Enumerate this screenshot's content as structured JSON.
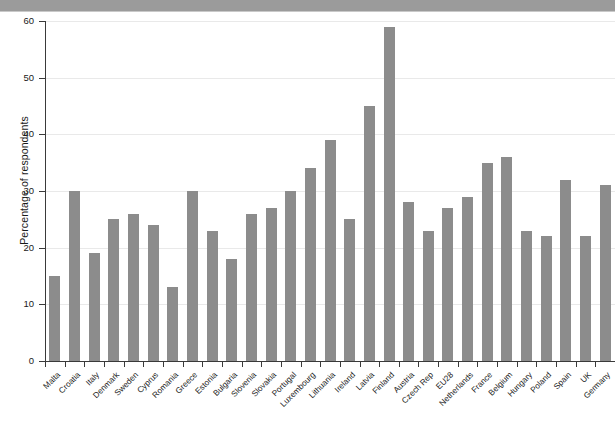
{
  "figure": {
    "banner_color": "#9b9b9b",
    "bar_color": "#8c8c8c",
    "grid_color": "#e9e9e9",
    "axis_color": "#3a3a3a"
  },
  "chart_data": {
    "type": "bar",
    "title": "",
    "subtitle": "",
    "xlabel": "",
    "ylabel": "Percentage of respondents",
    "ylim": [
      0,
      60
    ],
    "yticks": [
      0,
      10,
      20,
      30,
      40,
      50,
      60
    ],
    "ytick_labels": [
      "0",
      "10",
      "20",
      "30",
      "40",
      "50",
      "60"
    ],
    "grid": true,
    "legend": false,
    "legend_position": "none",
    "categories": [
      "Malta",
      "Croatia",
      "Italy",
      "Denmark",
      "Sweden",
      "Cyprus",
      "Romania",
      "Greece",
      "Estonia",
      "Bulgaria",
      "Slovenia",
      "Slovakia",
      "Portugal",
      "Luxembourg",
      "Lithuania",
      "Ireland",
      "Latvia",
      "Finland",
      "Austria",
      "Czech Rep",
      "EU28",
      "Netherlands",
      "France",
      "Belgium",
      "Hungary",
      "Poland",
      "Spain",
      "UK",
      "Germany"
    ],
    "values": [
      15,
      30,
      19,
      25,
      26,
      24,
      13,
      30,
      23,
      18,
      26,
      27,
      30,
      34,
      39,
      25,
      45,
      59,
      28,
      23,
      27,
      29,
      35,
      36,
      23,
      22,
      32,
      22,
      31
    ]
  }
}
